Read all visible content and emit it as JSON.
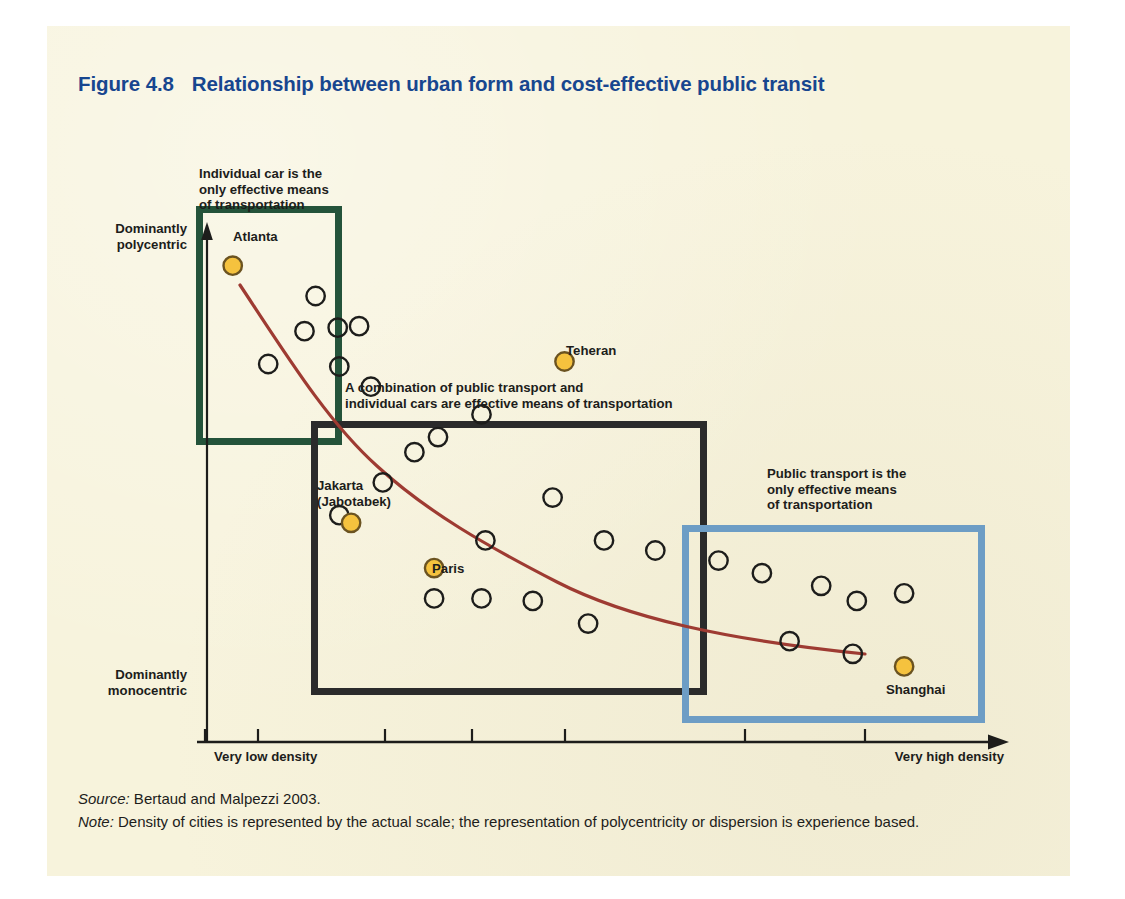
{
  "figure": {
    "number": "Figure 4.8",
    "title": "Relationship between urban form and cost-effective public transit"
  },
  "axes": {
    "y_top_label": "Dominantly\npolycentric",
    "y_bottom_label": "Dominantly\nmonocentric",
    "x_left_label": "Very low density",
    "x_right_label": "Very high density"
  },
  "annotations": [
    {
      "id": "green-region-note",
      "text": "Individual car is the\nonly effective means\nof transportation",
      "color": "#1d1d1b"
    },
    {
      "id": "dark-region-note",
      "text": "A combination of public transport and\nindividual cars are effective means of transportation",
      "color": "#1d1d1b"
    },
    {
      "id": "blue-region-note",
      "text": "Public transport is the\nonly effective means\nof transportation",
      "color": "#1d1d1b"
    }
  ],
  "regions": [
    {
      "id": "green-region",
      "color": "#24533a",
      "meaning": "Individual car only"
    },
    {
      "id": "dark-region",
      "color": "#2b2b2b",
      "meaning": "Combination of public transport and individual cars"
    },
    {
      "id": "blue-region",
      "color": "#6d9dc5",
      "meaning": "Public transport only"
    }
  ],
  "footer": {
    "source_lead": "Source:",
    "source_text": " Bertaud and Malpezzi 2003.",
    "note_lead": "Note:",
    "note_text": " Density of cities is represented by the actual scale; the representation of  polycentricity or dispersion is experience based."
  },
  "chart_data": {
    "type": "scatter",
    "title": "Relationship between urban form and cost-effective public transit",
    "xlabel": "Density of cities (very low density → very high density)",
    "ylabel": "Urban form (dominantly monocentric → dominantly polycentric)",
    "xlim": [
      0,
      100
    ],
    "ylim": [
      0,
      100
    ],
    "grid": false,
    "legend": "none",
    "x_ticks": [
      "Very low density",
      "",
      "",
      "",
      "",
      "",
      "Very high density"
    ],
    "y_ticks": [
      "Dominantly monocentric",
      "Dominantly polycentric"
    ],
    "trendline": {
      "name": "Declining exponential trend",
      "color": "#9e3b32",
      "points": [
        [
          7.7,
          87.0
        ],
        [
          12.0,
          80.0
        ],
        [
          16.0,
          72.0
        ],
        [
          20.0,
          64.0
        ],
        [
          24.5,
          56.0
        ],
        [
          29.5,
          48.5
        ],
        [
          35.0,
          42.0
        ],
        [
          41.0,
          36.5
        ],
        [
          48.0,
          31.5
        ],
        [
          56.0,
          27.5
        ],
        [
          65.0,
          24.5
        ],
        [
          75.0,
          22.0
        ],
        [
          85.0,
          20.5
        ],
        [
          91.5,
          19.5
        ]
      ]
    },
    "labeled_points": [
      {
        "name": "Atlanta",
        "x": 3.5,
        "y": 94.5,
        "marker": "filled",
        "label_pos": "right"
      },
      {
        "name": "Teheran",
        "x": 45.5,
        "y": 75.5,
        "marker": "filled",
        "label_pos": "right"
      },
      {
        "name": "Jakarta (Jabotabek)",
        "x": 18.5,
        "y": 43.5,
        "marker": "filled",
        "label_pos": "above"
      },
      {
        "name": "Paris",
        "x": 29.0,
        "y": 34.5,
        "marker": "filled",
        "label_pos": "right"
      },
      {
        "name": "Shanghai",
        "x": 88.5,
        "y": 15.0,
        "marker": "filled",
        "label_pos": "below"
      }
    ],
    "unlabeled_points": [
      {
        "x": 14.0,
        "y": 88.5
      },
      {
        "x": 12.6,
        "y": 81.5
      },
      {
        "x": 16.8,
        "y": 82.2
      },
      {
        "x": 19.5,
        "y": 82.5
      },
      {
        "x": 8.0,
        "y": 75.0
      },
      {
        "x": 17.0,
        "y": 74.5
      },
      {
        "x": 21.0,
        "y": 70.5
      },
      {
        "x": 35.0,
        "y": 65.0
      },
      {
        "x": 29.5,
        "y": 60.5
      },
      {
        "x": 26.5,
        "y": 57.5
      },
      {
        "x": 22.5,
        "y": 51.5
      },
      {
        "x": 44.0,
        "y": 48.5
      },
      {
        "x": 17.0,
        "y": 45.0
      },
      {
        "x": 35.5,
        "y": 40.0
      },
      {
        "x": 50.5,
        "y": 40.0
      },
      {
        "x": 57.0,
        "y": 38.0
      },
      {
        "x": 65.0,
        "y": 36.0
      },
      {
        "x": 29.0,
        "y": 28.5
      },
      {
        "x": 35.0,
        "y": 28.5
      },
      {
        "x": 41.5,
        "y": 28.0
      },
      {
        "x": 70.5,
        "y": 33.5
      },
      {
        "x": 78.0,
        "y": 31.0
      },
      {
        "x": 48.5,
        "y": 23.5
      },
      {
        "x": 88.5,
        "y": 29.5
      },
      {
        "x": 82.5,
        "y": 28.0
      },
      {
        "x": 74.0,
        "y": 20.0
      },
      {
        "x": 82.0,
        "y": 17.5
      }
    ]
  }
}
